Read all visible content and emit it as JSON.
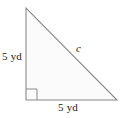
{
  "figure": {
    "type": "right-triangle-diagram",
    "stroke_color": "#8a8a8a",
    "fill_color": "#fbfbfb",
    "text_color": "#1b1b1b",
    "labels": {
      "left_leg": "5 yd",
      "bottom_leg": "5 yd",
      "hypotenuse": "c"
    },
    "right_angle": {
      "marker": "square",
      "position": "bottom-left"
    },
    "vertices": {
      "top": [
        26,
        8
      ],
      "bottom_left": [
        26,
        100
      ],
      "bottom_right": [
        117,
        100
      ]
    }
  }
}
